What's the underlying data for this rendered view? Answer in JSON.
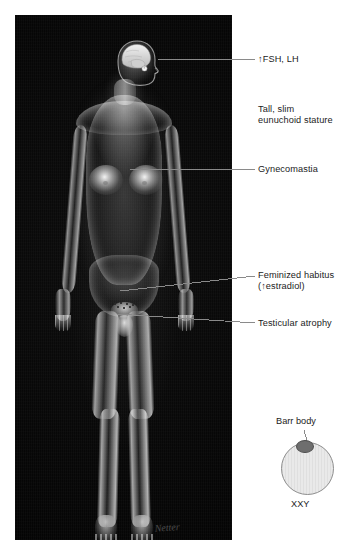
{
  "panel": {
    "background_color": "#000000",
    "signature": "Netter"
  },
  "annotations": [
    {
      "id": "fsh-lh",
      "text": "↑FSH, LH",
      "has_leader_line": true,
      "target": "pituitary gland",
      "text_x": 258,
      "text_y": 54,
      "leader": {
        "x1": 158,
        "y1": 59,
        "x2": 255,
        "y2": 59
      }
    },
    {
      "id": "eunuchoid-stature",
      "text": "Tall, slim\neunuchoid stature",
      "has_leader_line": false,
      "target": "whole body habitus",
      "text_x": 258,
      "text_y": 104
    },
    {
      "id": "gynecomastia",
      "text": "Gynecomastia",
      "has_leader_line": true,
      "target": "left breast",
      "text_x": 258,
      "text_y": 164,
      "leader": {
        "x1": 130,
        "y1": 169,
        "x2": 255,
        "y2": 169
      }
    },
    {
      "id": "feminized-habitus",
      "text": "Feminized habitus\n(↑estradiol)",
      "has_leader_line": true,
      "target": "pubic hair distribution",
      "text_x": 258,
      "text_y": 270,
      "leader": {
        "x1": 120,
        "y1": 291,
        "x2": 255,
        "y2": 276
      }
    },
    {
      "id": "testicular-atrophy",
      "text": "Testicular atrophy",
      "has_leader_line": true,
      "target": "testes",
      "text_x": 258,
      "text_y": 318,
      "leader": {
        "x1": 117,
        "y1": 314,
        "x2": 255,
        "y2": 323
      }
    }
  ],
  "inset": {
    "label_top": "Barr body",
    "label_bottom": "XXY",
    "label_top_x": 276,
    "label_top_y": 421,
    "label_bottom_x": 291,
    "label_bottom_y": 504,
    "nucleus_fill": "#e9e9e9",
    "nucleus_stroke": "#8d8d8d",
    "barr_body_fill": "#6e6e6e",
    "leader": {
      "x1": 304,
      "y1": 430,
      "x2": 307,
      "y2": 441
    }
  },
  "colors": {
    "panel_bg": "#000000",
    "page_bg": "#ffffff",
    "text": "#1b1b1b",
    "leader_line": "#8a8a8a"
  }
}
